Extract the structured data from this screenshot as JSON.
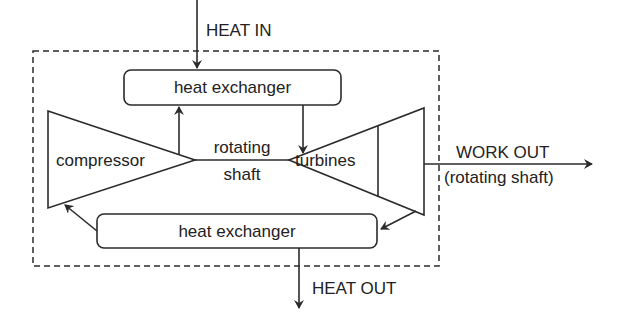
{
  "diagram": {
    "labels": {
      "heat_in": "HEAT IN",
      "heat_out": "HEAT OUT",
      "work_out": "WORK OUT",
      "work_out_sub": "(rotating shaft)",
      "top_heat_exchanger": "heat exchanger",
      "bottom_heat_exchanger": "heat exchanger",
      "compressor": "compressor",
      "turbines": "turbines",
      "shaft_line1": "rotating",
      "shaft_line2": "shaft"
    },
    "colors": {
      "stroke": "#2b2b2b",
      "text": "#222222",
      "background": "#ffffff"
    }
  }
}
